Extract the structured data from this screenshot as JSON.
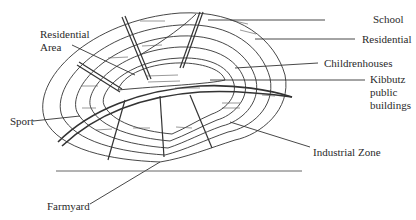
{
  "diagram": {
    "type": "kibbutz concentric layout plan (hand-drawn sketch)",
    "colors": {
      "ink": "#2a2a2a",
      "line": "#333333",
      "background": "#ffffff"
    },
    "labels": {
      "school": "School",
      "residential": "Residential",
      "residential_area_1": "Residential",
      "residential_area_2": "Area",
      "childrenhouses": "Childrenhouses",
      "kibbutz_1": "Kibbutz",
      "kibbutz_2": "public",
      "kibbutz_3": "buildings",
      "sport": "Sport",
      "industrial_zone": "Industrial Zone",
      "farmyard": "Farmyard"
    }
  }
}
